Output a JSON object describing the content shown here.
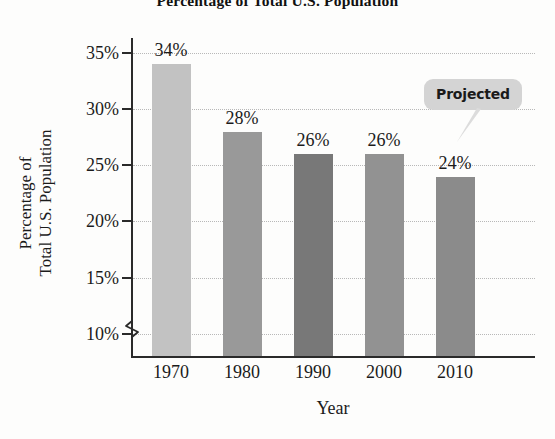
{
  "chart_data": {
    "type": "bar",
    "title": "Percentage of Total U.S. Population",
    "xlabel": "Year",
    "ylabel": "Percentage of Total U.S. Population",
    "ylabel_lines": [
      "Percentage of",
      "Total U.S. Population"
    ],
    "categories": [
      "1970",
      "1980",
      "1990",
      "2000",
      "2010"
    ],
    "values": [
      34,
      28,
      26,
      26,
      24
    ],
    "value_labels": [
      "34%",
      "28%",
      "26%",
      "26%",
      "24%"
    ],
    "bar_colors": [
      "#c2c2c2",
      "#999999",
      "#787878",
      "#929292",
      "#8b8b8b"
    ],
    "ylim": [
      8,
      36
    ],
    "yticks": [
      10,
      15,
      20,
      25,
      30,
      35
    ],
    "ytick_labels": [
      "10%",
      "15%",
      "20%",
      "25%",
      "30%",
      "35%"
    ],
    "grid": true,
    "grid_style": "dotted",
    "grid_color": "#b8b8b8",
    "axis_break": true,
    "legend": "none",
    "annotations": [
      {
        "text": "Projected",
        "target_category": "2010",
        "style": "callout-bubble",
        "color": "#d4d4d4"
      }
    ]
  }
}
